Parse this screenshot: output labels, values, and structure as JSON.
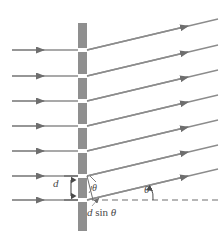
{
  "figure": {
    "background": "#ffffff",
    "width": 222,
    "height": 234
  },
  "colors": {
    "ray": "#8c8c8c",
    "ray_dark": "#6e6e6e",
    "barrier": "#8f8f8f",
    "barrier_edge": "#7a7a7a",
    "dashed": "#6e6e6e",
    "text": "#4a4a4a",
    "leader": "#9a9a9a"
  },
  "labels": {
    "slit_spacing": "d",
    "theta_slit": "θ",
    "theta_axis": "θ",
    "path_difference_d": "d",
    "path_difference_sin": "sin",
    "path_difference_theta": "θ",
    "path_difference_full": "d sin θ"
  },
  "geometry": {
    "barrier_x": 78,
    "barrier_width": 9,
    "barrier_top": 23,
    "barrier_bottom": 231,
    "slit_count": 7,
    "ray_count": 7,
    "incoming_ray_x_start": 12,
    "incoming_ray_arrow_x": 42,
    "outgoing_ray_x_end": 218,
    "dashed_line_y": 200,
    "dashed_line_x_start": 92,
    "dashed_line_x_end": 219,
    "theta_degrees": 13,
    "slit_y_positions": [
      50,
      76,
      101,
      126,
      151,
      176,
      200
    ]
  },
  "elements": {
    "incoming_rays": "incident plane-wave rays travelling left to right",
    "outgoing_rays": "diffracted rays leaving at angle theta",
    "barrier": "opaque grating with evenly spaced slits",
    "dashed_axis": "horizontal reference axis",
    "d_arrow": "double headed arrow marking slit spacing d",
    "path_leader": "leader line pointing to the path difference segment"
  }
}
